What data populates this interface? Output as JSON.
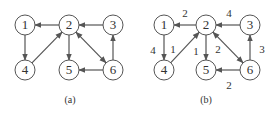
{
  "graphs": [
    {
      "caption": "(a)",
      "nodes": [
        {
          "id": "1",
          "label": "1",
          "x": 25,
          "y": 25
        },
        {
          "id": "2",
          "label": "2",
          "x": 69,
          "y": 25
        },
        {
          "id": "3",
          "label": "3",
          "x": 113,
          "y": 25
        },
        {
          "id": "4",
          "label": "4",
          "x": 25,
          "y": 70
        },
        {
          "id": "5",
          "label": "5",
          "x": 69,
          "y": 70
        },
        {
          "id": "6",
          "label": "6",
          "x": 113,
          "y": 70
        }
      ],
      "edges": [
        {
          "from": "2",
          "to": "1"
        },
        {
          "from": "1",
          "to": "4"
        },
        {
          "from": "4",
          "to": "2"
        },
        {
          "from": "2",
          "to": "5"
        },
        {
          "from": "2",
          "to": "6",
          "bidirectional": true
        },
        {
          "from": "3",
          "to": "2"
        },
        {
          "from": "6",
          "to": "3"
        },
        {
          "from": "6",
          "to": "5"
        }
      ]
    },
    {
      "caption": "(b)",
      "nodes": [
        {
          "id": "1",
          "label": "1",
          "x": 164,
          "y": 25
        },
        {
          "id": "2",
          "label": "2",
          "x": 206,
          "y": 25
        },
        {
          "id": "3",
          "label": "3",
          "x": 250,
          "y": 25
        },
        {
          "id": "4",
          "label": "4",
          "x": 164,
          "y": 70
        },
        {
          "id": "5",
          "label": "5",
          "x": 206,
          "y": 70
        },
        {
          "id": "6",
          "label": "6",
          "x": 250,
          "y": 70
        }
      ],
      "edges": [
        {
          "from": "2",
          "to": "1",
          "weight": "2",
          "lx": 185,
          "ly": 14
        },
        {
          "from": "1",
          "to": "4",
          "weight": "4",
          "lx": 153,
          "ly": 51
        },
        {
          "from": "4",
          "to": "2",
          "weight": "1",
          "lx": 173,
          "ly": 50
        },
        {
          "from": "2",
          "to": "5",
          "weight": "1",
          "lx": 196,
          "ly": 52
        },
        {
          "from": "2",
          "to": "6",
          "weight": "2",
          "lx": 218,
          "ly": 50,
          "bidirectional": true
        },
        {
          "from": "3",
          "to": "2",
          "weight": "4",
          "lx": 229,
          "ly": 14
        },
        {
          "from": "6",
          "to": "3",
          "weight": "3",
          "lx": 262,
          "ly": 50
        },
        {
          "from": "6",
          "to": "5",
          "weight": "2",
          "lx": 229,
          "ly": 86
        }
      ]
    }
  ],
  "caption_positions": [
    {
      "x": 70,
      "y": 101
    },
    {
      "x": 206,
      "y": 101
    }
  ],
  "colors": {
    "stroke": "#555555",
    "text": "#333333",
    "background": "#ffffff"
  }
}
